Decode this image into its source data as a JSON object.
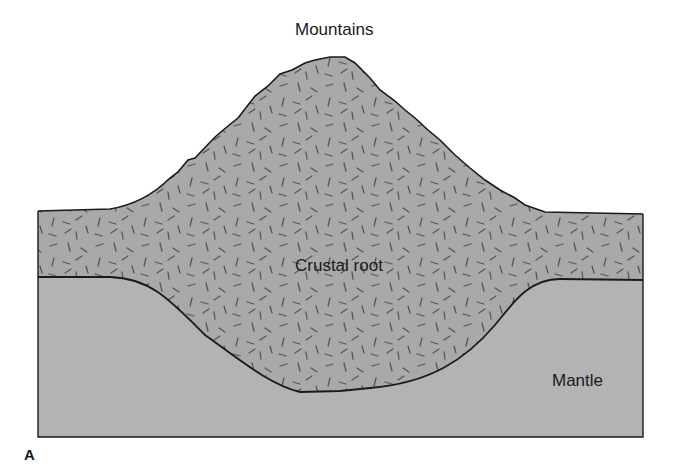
{
  "figure": {
    "panel_label": "A",
    "labels": {
      "mountains": "Mountains",
      "crustal_root": "Crustal root",
      "mantle": "Mantle"
    }
  },
  "colors": {
    "background": "#ffffff",
    "crust_fill": "#a9a9a9",
    "mantle_fill": "#b3b3b3",
    "outline": "#1a1a1a",
    "dash_marks": "#555555"
  }
}
